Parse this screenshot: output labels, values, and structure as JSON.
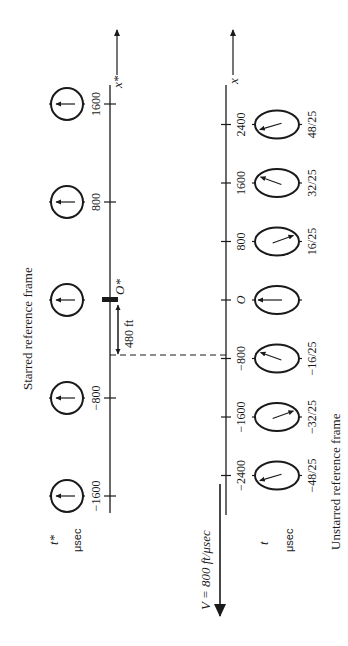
{
  "figure": {
    "starred_frame": {
      "title": "Starred reference frame",
      "axis_label": "x*",
      "origin_label": "O*",
      "time_label": "t*",
      "time_unit": "μsec",
      "ticks": [
        {
          "value": 1600,
          "label": "1600"
        },
        {
          "value": 800,
          "label": "800"
        },
        {
          "value": 0,
          "label": ""
        },
        {
          "value": -800,
          "label": "−800"
        },
        {
          "value": -1600,
          "label": "−1600"
        }
      ],
      "clocks": [
        {
          "x": 1600,
          "hand": "up"
        },
        {
          "x": 800,
          "hand": "up"
        },
        {
          "x": 0,
          "hand": "up"
        },
        {
          "x": -800,
          "hand": "up"
        },
        {
          "x": -1600,
          "hand": "up"
        }
      ],
      "offset_label": "480 ft"
    },
    "unstarred_frame": {
      "title": "Unstarred reference frame",
      "axis_label": "x",
      "origin_label": "O",
      "time_label": "t",
      "time_unit": "μsec",
      "velocity_label": "V = 800 ft/μsec",
      "ticks": [
        {
          "value": 2400,
          "label": "2400"
        },
        {
          "value": 1600,
          "label": "1600"
        },
        {
          "value": 800,
          "label": "800"
        },
        {
          "value": 0,
          "label": "O"
        },
        {
          "value": -800,
          "label": "−800"
        },
        {
          "value": -1600,
          "label": "−1600"
        },
        {
          "value": -2400,
          "label": "−2400"
        }
      ],
      "clocks": [
        {
          "x": 2400,
          "time": "48/25",
          "hand_angle_deg": -25
        },
        {
          "x": 1600,
          "time": "32/25",
          "hand_angle_deg": 30
        },
        {
          "x": 800,
          "time": "16/25",
          "hand_angle_deg": 150
        },
        {
          "x": 0,
          "time": "",
          "hand_angle_deg": 0
        },
        {
          "x": -800,
          "time": "−16/25",
          "hand_angle_deg": 30
        },
        {
          "x": -1600,
          "time": "−32/25",
          "hand_angle_deg": 150
        },
        {
          "x": -2400,
          "time": "−48/25",
          "hand_angle_deg": -25
        }
      ]
    }
  }
}
